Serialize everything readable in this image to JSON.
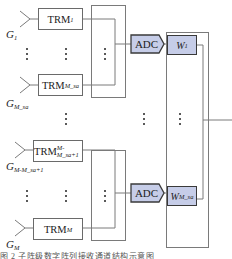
{
  "diagram": {
    "type": "block-diagram",
    "antennas": [
      {
        "id": "g1",
        "label": "G",
        "sub": "1"
      },
      {
        "id": "g_msa",
        "label": "G",
        "sub": "M_sa"
      },
      {
        "id": "g_m_msa_1",
        "label": "G",
        "sub": "M-M_sa+1"
      },
      {
        "id": "g_m",
        "label": "G",
        "sub": "M"
      }
    ],
    "trm_blocks": [
      {
        "id": "trm1",
        "label": "TRM",
        "sub": "1"
      },
      {
        "id": "trm_msa",
        "label": "TRM",
        "sub": "M_sa"
      },
      {
        "id": "trm_m_msa_1",
        "label": "TRM",
        "sub": "M-M_sa+1"
      },
      {
        "id": "trm_m",
        "label": "TRM",
        "sub": "M"
      }
    ],
    "adc_blocks": [
      {
        "id": "adc1",
        "label": "ADC"
      },
      {
        "id": "adc2",
        "label": "ADC"
      }
    ],
    "weight_blocks": [
      {
        "id": "w1",
        "label": "W",
        "sub": "1"
      },
      {
        "id": "w_msa",
        "label": "W",
        "sub": "M_sa"
      }
    ],
    "ellipsis": "⋮",
    "colors": {
      "line": "#7a7a7a",
      "block_fill": "#c6cde8",
      "block_border": "#3a3a3a",
      "text": "#222222"
    },
    "caption": "图 2  子阵级数字阵列接收通道结构示意图"
  }
}
